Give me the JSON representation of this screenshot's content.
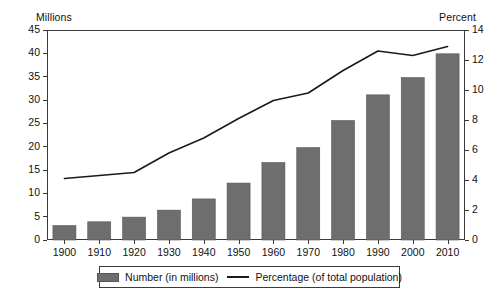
{
  "axes": {
    "left_caption": "Millions",
    "right_caption": "Percent",
    "left_ticks": [
      "0",
      "5",
      "10",
      "15",
      "20",
      "25",
      "30",
      "35",
      "40",
      "45"
    ],
    "right_ticks": [
      "0",
      "2",
      "4",
      "6",
      "8",
      "10",
      "12",
      "14"
    ],
    "x_ticks": [
      "1900",
      "1910",
      "1920",
      "1930",
      "1940",
      "1950",
      "1960",
      "1970",
      "1980",
      "1990",
      "2000",
      "2010"
    ]
  },
  "legend": {
    "bar_label": "Number (in millions)",
    "line_label": "Percentage (of total population)",
    "bar_color": "#6e6e6e",
    "line_color": "#1a1a1a"
  },
  "chart_data": {
    "type": "bar",
    "title": "",
    "subtitle": "",
    "xlabel": "",
    "ylabel": "Millions",
    "y2label": "Percent",
    "ylim": [
      0,
      45
    ],
    "y2lim": [
      0,
      14
    ],
    "grid": false,
    "legend_position": "bottom",
    "categories": [
      "1900",
      "1910",
      "1920",
      "1930",
      "1940",
      "1950",
      "1960",
      "1970",
      "1980",
      "1990",
      "2000",
      "2010"
    ],
    "series": [
      {
        "name": "Number (in millions)",
        "type": "bar",
        "axis": "left",
        "color": "#6e6e6e",
        "values": [
          3.1,
          3.9,
          4.9,
          6.4,
          8.8,
          12.2,
          16.6,
          19.8,
          25.6,
          31.1,
          34.8,
          39.9
        ]
      },
      {
        "name": "Percentage (of total population)",
        "type": "line",
        "axis": "right",
        "color": "#1a1a1a",
        "values": [
          4.1,
          4.3,
          4.5,
          5.8,
          6.8,
          8.1,
          9.3,
          9.8,
          11.3,
          12.6,
          12.3,
          12.9
        ]
      }
    ]
  }
}
